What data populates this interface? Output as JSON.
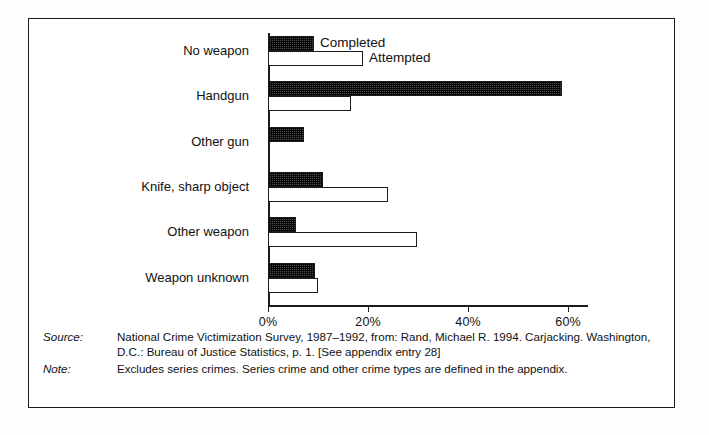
{
  "chart_data": {
    "type": "bar",
    "orientation": "horizontal",
    "title": "",
    "xlabel": "",
    "ylabel": "",
    "xlim": [
      0,
      64
    ],
    "xticks": [
      "0%",
      "20%",
      "40%",
      "60%"
    ],
    "xtick_values": [
      0,
      20,
      40,
      60
    ],
    "grid": false,
    "legend_position": "inline-right-of-first-group",
    "categories": [
      "No weapon",
      "Handgun",
      "Other gun",
      "Knife, sharp object",
      "Other weapon",
      "Weapon unknown"
    ],
    "series": [
      {
        "name": "Completed",
        "values": [
          9.2,
          58.7,
          7.2,
          10.9,
          5.6,
          9.4
        ]
      },
      {
        "name": "Attempted",
        "values": [
          19.0,
          16.5,
          0.0,
          24.0,
          29.7,
          10.0
        ]
      }
    ],
    "annotations": [
      "Completed",
      "Attempted"
    ],
    "colors": {
      "completed": "#4a4a4a",
      "attempted": "#ffffff",
      "axis": "#1c1c1c"
    }
  },
  "footer": {
    "source_key": "Source:",
    "source_text": "National Crime Victimization Survey, 1987–1992, from: Rand, Michael R. 1994. Carjacking. Washington, D.C.: Bureau of Justice Statistics, p. 1. [See appendix entry 28]",
    "note_key": "Note:",
    "note_text": "Excludes series crimes. Series crime and other crime types are defined in the appendix."
  }
}
